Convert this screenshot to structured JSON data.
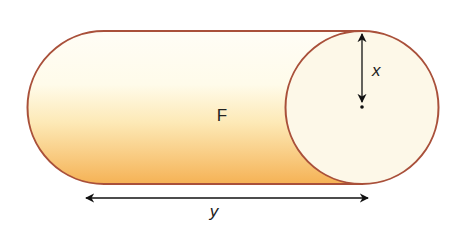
{
  "diagram": {
    "title": "",
    "shape": "cylinder-side-view",
    "labels": {
      "face": "F",
      "radius": "x",
      "length": "y"
    },
    "colors": {
      "outline": "#a9503a",
      "body_top": "#fffdf4",
      "body_bottom": "#f6b85a",
      "end_face": "#fdf8e8",
      "arrow": "#111111"
    }
  }
}
